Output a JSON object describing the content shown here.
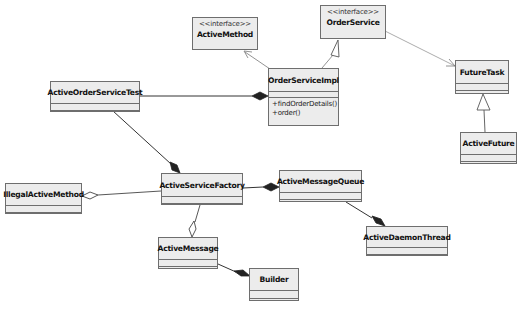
{
  "diagram": {
    "type": "UML class diagram",
    "colors": {
      "box_fill": "#ececec",
      "box_border": "#6e6e6e",
      "line": "#555555",
      "diamond_fill": "#222222"
    },
    "classes": {
      "active_method": {
        "stereotype": "<<interface>>",
        "name": "ActiveMethod"
      },
      "order_service": {
        "stereotype": "<<interface>>",
        "name": "OrderService"
      },
      "order_service_impl": {
        "name": "OrderServiceImpl",
        "operations": [
          "+findOrderDetails()",
          "+order()"
        ]
      },
      "active_order_service_test": {
        "name": "ActiveOrderServiceTest"
      },
      "future_task": {
        "name": "FutureTask"
      },
      "active_future": {
        "name": "ActiveFuture"
      },
      "illegal_active_method": {
        "name": "IllegalActiveMethod"
      },
      "active_service_factory": {
        "name": "ActiveServiceFactory"
      },
      "active_message_queue": {
        "name": "ActiveMessageQueue"
      },
      "active_daemon_thread": {
        "name": "ActiveDaemonThread"
      },
      "active_message": {
        "name": "ActiveMessage"
      },
      "builder": {
        "name": "Builder"
      }
    },
    "relationships": [
      {
        "from": "OrderServiceImpl",
        "to": "ActiveMethod",
        "kind": "dependency"
      },
      {
        "from": "OrderServiceImpl",
        "to": "OrderService",
        "kind": "realization"
      },
      {
        "from": "OrderService",
        "to": "FutureTask",
        "kind": "dependency"
      },
      {
        "from": "ActiveFuture",
        "to": "FutureTask",
        "kind": "generalization"
      },
      {
        "from": "ActiveOrderServiceTest",
        "to": "OrderServiceImpl",
        "kind": "composition"
      },
      {
        "from": "ActiveOrderServiceTest",
        "to": "ActiveServiceFactory",
        "kind": "composition"
      },
      {
        "from": "ActiveServiceFactory",
        "to": "IllegalActiveMethod",
        "kind": "aggregation"
      },
      {
        "from": "ActiveServiceFactory",
        "to": "ActiveMessageQueue",
        "kind": "composition"
      },
      {
        "from": "ActiveMessageQueue",
        "to": "ActiveDaemonThread",
        "kind": "composition"
      },
      {
        "from": "ActiveServiceFactory",
        "to": "ActiveMessage",
        "kind": "aggregation"
      },
      {
        "from": "ActiveMessage",
        "to": "Builder",
        "kind": "composition"
      }
    ]
  }
}
